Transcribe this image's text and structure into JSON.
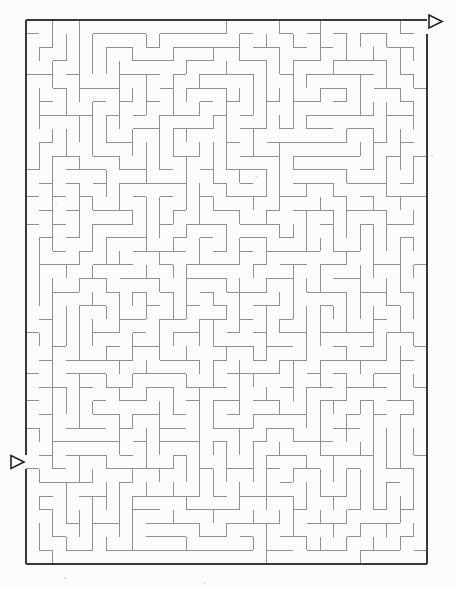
{
  "page": {
    "width": 455,
    "height": 589,
    "background_color": "#fcfcfb"
  },
  "maze": {
    "kind": "rectangular-grid-maze",
    "cols": 30,
    "rows": 40,
    "left": 26,
    "top": 20,
    "right": 427,
    "bottom": 564,
    "wall_color": "#919191",
    "wall_width": 1,
    "border_color": "#383838",
    "border_width": 2.5,
    "generator_seed": 987613,
    "entry": {
      "side": "left",
      "row_index": 32,
      "arrow_direction": "right"
    },
    "exit": {
      "side": "right",
      "row_index": 0,
      "arrow_direction": "right"
    },
    "arrow": {
      "length": 13,
      "height": 13,
      "fill": "#ffffff",
      "stroke": "#222222",
      "stroke_width": 1.6
    }
  },
  "noise_specks": [
    {
      "x": 257,
      "y": 177,
      "r": 1
    },
    {
      "x": 65,
      "y": 578,
      "r": 1
    },
    {
      "x": 432,
      "y": 156,
      "r": 1
    },
    {
      "x": 205,
      "y": 583,
      "r": 1
    },
    {
      "x": 56,
      "y": 203,
      "r": 1
    }
  ]
}
